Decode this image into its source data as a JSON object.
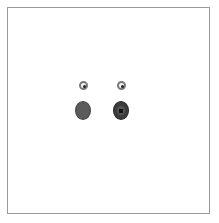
{
  "figure": {
    "frame": {
      "border_color": "#9a9a9a",
      "background": "#ffffff"
    },
    "shapes": [
      {
        "id": "small-ring-left",
        "type": "ring",
        "cx": 83,
        "cy": 85,
        "color": "#7a7a7a"
      },
      {
        "id": "small-ring-right",
        "type": "ring",
        "cx": 121,
        "cy": 85,
        "color": "#7a7a7a"
      },
      {
        "id": "large-oval-left",
        "type": "oval",
        "cx": 83,
        "cy": 111,
        "color": "#5b5b5b"
      },
      {
        "id": "large-oval-right",
        "type": "oval-with-center",
        "cx": 121,
        "cy": 111,
        "color": "#3c3c3c"
      }
    ]
  }
}
